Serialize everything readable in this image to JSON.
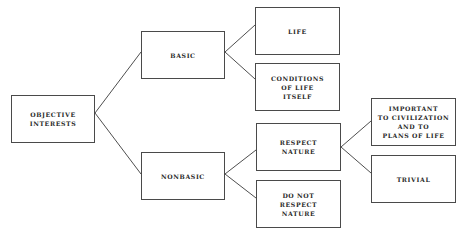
{
  "diagram": {
    "type": "tree",
    "nodes": [
      {
        "id": "objective",
        "label": "OBJECTIVE\nINTERESTS",
        "x": 11,
        "y": 95,
        "w": 84,
        "h": 48
      },
      {
        "id": "basic",
        "label": "BASIC",
        "x": 141,
        "y": 31,
        "w": 84,
        "h": 48
      },
      {
        "id": "nonbasic",
        "label": "NONBASIC",
        "x": 141,
        "y": 152,
        "w": 84,
        "h": 48
      },
      {
        "id": "life",
        "label": "LIFE",
        "x": 255,
        "y": 7,
        "w": 85,
        "h": 48
      },
      {
        "id": "conditions",
        "label": "CONDITIONS\nOF LIFE\nITSELF",
        "x": 255,
        "y": 63,
        "w": 85,
        "h": 48
      },
      {
        "id": "respect",
        "label": "RESPECT\nNATURE",
        "x": 256,
        "y": 123,
        "w": 85,
        "h": 48
      },
      {
        "id": "donot",
        "label": "DO NOT\nRESPECT\nNATURE",
        "x": 256,
        "y": 180,
        "w": 85,
        "h": 48
      },
      {
        "id": "important",
        "label": "IMPORTANT\nTO CIVILIZATION\nAND TO\nPLANS OF LIFE",
        "x": 371,
        "y": 98,
        "w": 85,
        "h": 48
      },
      {
        "id": "trivial",
        "label": "TRIVIAL",
        "x": 371,
        "y": 155,
        "w": 85,
        "h": 48
      }
    ],
    "edges": [
      [
        "objective",
        "basic"
      ],
      [
        "objective",
        "nonbasic"
      ],
      [
        "basic",
        "life"
      ],
      [
        "basic",
        "conditions"
      ],
      [
        "nonbasic",
        "respect"
      ],
      [
        "nonbasic",
        "donot"
      ],
      [
        "respect",
        "important"
      ],
      [
        "respect",
        "trivial"
      ]
    ]
  }
}
